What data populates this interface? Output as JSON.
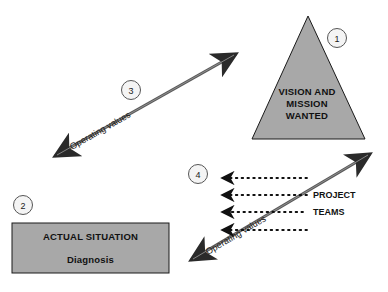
{
  "diagram": {
    "background_color": "#ffffff",
    "shape_fill": "#a8a8a8",
    "shape_stroke": "#1a1a1a",
    "arrow_color": "#4a4a4a",
    "dotted_arrow_color": "#111111",
    "badge_fill": "#f4f4f4",
    "badge_stroke": "#555555"
  },
  "triangle": {
    "badge": "1",
    "lines": [
      "VISION AND",
      "MISSION",
      "WANTED"
    ]
  },
  "rectangle": {
    "badge": "2",
    "title": "ACTUAL SITUATION",
    "subtitle": "Diagnosis"
  },
  "arrow_upper": {
    "badge": "3",
    "label": "Operating values"
  },
  "arrow_lower": {
    "badge": "4",
    "label": "Operating values",
    "side_labels": [
      "PROJECT",
      "TEAMS"
    ],
    "dotted_arrow_count": "4"
  }
}
